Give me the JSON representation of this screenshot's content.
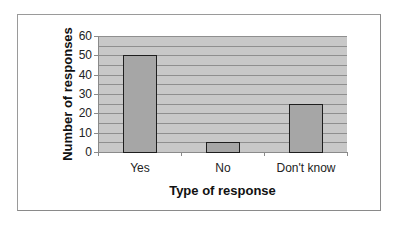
{
  "chart_data": {
    "type": "bar",
    "title": "",
    "categories": [
      "Yes",
      "No",
      "Don't know"
    ],
    "values": [
      50,
      5,
      25
    ],
    "xlabel": "Type of response",
    "ylabel": "Number of responses",
    "ylim": [
      0,
      60
    ],
    "yticks": [
      "0",
      "10",
      "20",
      "30",
      "40",
      "50",
      "60"
    ],
    "grid": true,
    "grid_step": 5,
    "legend": "none",
    "colors": {
      "bar_fill": "#a6a6a6",
      "bar_border": "#1e1e1e",
      "plot_background": "#c8c8c8",
      "gridline": "#8f8f8f"
    }
  }
}
